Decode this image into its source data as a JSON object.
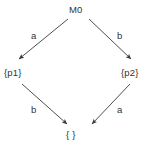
{
  "diagram": {
    "type": "state-transition-diagram",
    "background_color": "#ffffff",
    "line_color": "#3a3a3a",
    "text_color": "#333333",
    "nodes": [
      {
        "id": "m0",
        "label": "M0",
        "x": 78,
        "y": 10
      },
      {
        "id": "p1",
        "label": "{p1}",
        "x": 17,
        "y": 73
      },
      {
        "id": "p2",
        "label": "{p2}",
        "x": 134,
        "y": 73
      },
      {
        "id": "empty",
        "label": "{ }",
        "x": 76,
        "y": 135
      }
    ],
    "edges": [
      {
        "id": "e1",
        "from": "m0",
        "to": "p1",
        "label": "a",
        "x1": 68,
        "y1": 19,
        "x2": 19,
        "y2": 59
      },
      {
        "id": "e2",
        "from": "m0",
        "to": "p2",
        "label": "b",
        "x1": 89,
        "y1": 19,
        "x2": 131,
        "y2": 59
      },
      {
        "id": "e3",
        "from": "p1",
        "to": "empty",
        "label": "b",
        "x1": 22,
        "y1": 84,
        "x2": 67,
        "y2": 124
      },
      {
        "id": "e4",
        "from": "p2",
        "to": "empty",
        "label": "a",
        "x1": 130,
        "y1": 84,
        "x2": 92,
        "y2": 124
      }
    ]
  }
}
